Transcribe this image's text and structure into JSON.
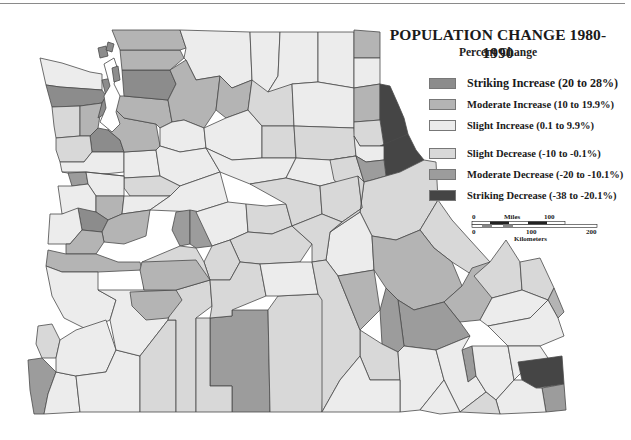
{
  "title": "POPULATION CHANGE 1980-1990",
  "subtitle": "Percent Change",
  "legend": {
    "items": [
      {
        "label": "Striking Increase (20 to 28%)",
        "color": "#8c8c8c"
      },
      {
        "label": "Moderate Increase (10 to 19.9%)",
        "color": "#b4b4b4"
      },
      {
        "label": "Slight Increase (0.1 to 9.9%)",
        "color": "#ececec"
      },
      {
        "label": "Slight Decrease (-10 to -0.1%)",
        "color": "#d8d8d8"
      },
      {
        "label": "Moderate Decrease (-20 to -10.1%)",
        "color": "#9c9c9c"
      },
      {
        "label": "Striking Decrease (-38 to -20.1%)",
        "color": "#454545"
      }
    ]
  },
  "scale_bar": {
    "miles_label": "Miles",
    "miles_ticks": [
      "0",
      "100"
    ],
    "km_label": "Kilometers",
    "km_ticks": [
      "0",
      "100",
      "200"
    ]
  },
  "map": {
    "region": "Pacific Northwest counties (Washington, Oregon, Idaho)",
    "water_color": "#ffffff",
    "border_color": "#4a4a4a"
  }
}
